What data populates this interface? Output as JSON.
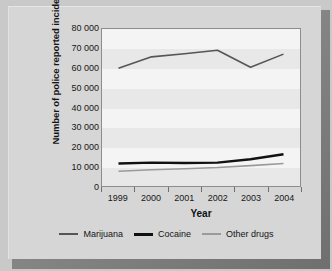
{
  "chart_data": {
    "type": "line",
    "title": "",
    "xlabel": "Year",
    "ylabel": "Number of police reported incidents",
    "categories": [
      "1999",
      "2000",
      "2001",
      "2002",
      "2003",
      "2004"
    ],
    "ylim": [
      0,
      80000
    ],
    "yticks": [
      0,
      10000,
      20000,
      30000,
      40000,
      50000,
      60000,
      70000,
      80000
    ],
    "ytick_labels": [
      "0",
      "10 000",
      "20 000",
      "30 000",
      "40 000",
      "50 000",
      "60 000",
      "70 000",
      "80 000"
    ],
    "grid": false,
    "banded_background": true,
    "legend_position": "bottom",
    "series": [
      {
        "name": "Marijuana",
        "color": "#555555",
        "width": 1.6,
        "values": [
          60000,
          65800,
          67400,
          69200,
          60500,
          67200
        ]
      },
      {
        "name": "Cocaine",
        "color": "#111111",
        "width": 2.4,
        "values": [
          11500,
          11900,
          11700,
          11900,
          13600,
          16200
        ]
      },
      {
        "name": "Other drugs",
        "color": "#9a9a9a",
        "width": 1.6,
        "values": [
          7500,
          8300,
          8800,
          9400,
          10400,
          11500
        ]
      }
    ]
  },
  "axes": {
    "y_title": "Number of police reported incidents",
    "x_title": "Year"
  },
  "legend": {
    "items": [
      {
        "label": "Marijuana",
        "color": "#555555",
        "thickness": "2px"
      },
      {
        "label": "Cocaine",
        "color": "#111111",
        "thickness": "3px"
      },
      {
        "label": "Other drugs",
        "color": "#9a9a9a",
        "thickness": "2px"
      }
    ]
  },
  "colors": {
    "page_background": "#c9c9c9",
    "card_background": "#d6d6d6",
    "plot_background": "#f4f4f4",
    "band": "#e8e8e8",
    "frame": "#8d8d8d",
    "text": "#161616"
  }
}
